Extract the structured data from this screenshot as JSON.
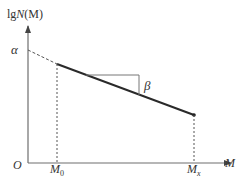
{
  "diagram": {
    "type": "log-log relation plot",
    "y_axis_label_prefix": "lg",
    "y_axis_label_main": "N",
    "y_axis_label_arg": "(M)",
    "x_axis_label": "M",
    "origin_label": "O",
    "intercept_label": "α",
    "slope_label": "β",
    "x_tick_start_main": "M",
    "x_tick_start_sub": "0",
    "x_tick_end_main": "M",
    "x_tick_end_sub": "x",
    "colors": {
      "axis": "#6e6e6e",
      "line": "#2a2a2a",
      "text": "#333333",
      "guide": "#555555"
    }
  }
}
